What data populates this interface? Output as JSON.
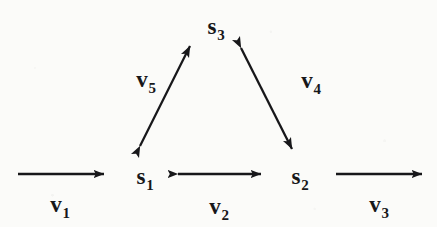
{
  "figure": {
    "kind": "state-transition-diagram",
    "background_color": "#fbfbf9",
    "ink_color": "#17171a",
    "width": 437,
    "height": 227
  },
  "nodes": [
    {
      "id": "s1",
      "base": "s",
      "sub": "1",
      "x": 145,
      "y": 176
    },
    {
      "id": "s2",
      "base": "s",
      "sub": "2",
      "x": 300,
      "y": 176
    },
    {
      "id": "s3",
      "base": "s",
      "sub": "3",
      "x": 216,
      "y": 26
    }
  ],
  "edges": [
    {
      "id": "v1",
      "base": "v",
      "sub": "1",
      "label_x": 60,
      "label_y": 204,
      "arrow": "single",
      "direction": "right",
      "from": "(boundary)",
      "to": "s1",
      "x1": 18,
      "y1": 174,
      "x2": 104,
      "y2": 174
    },
    {
      "id": "v2",
      "base": "v",
      "sub": "2",
      "label_x": 219,
      "label_y": 206,
      "arrow": "double",
      "direction": "horizontal",
      "from": "s1",
      "to": "s2",
      "x1": 178,
      "y1": 174,
      "x2": 261,
      "y2": 174
    },
    {
      "id": "v3",
      "base": "v",
      "sub": "3",
      "label_x": 379,
      "label_y": 204,
      "arrow": "single",
      "direction": "right",
      "from": "s2",
      "to": "(boundary)",
      "x1": 336,
      "y1": 174,
      "x2": 422,
      "y2": 174
    },
    {
      "id": "v4",
      "base": "v",
      "sub": "4",
      "label_x": 311,
      "label_y": 80,
      "arrow": "double",
      "direction": "diagonal-down-right",
      "from": "s3",
      "to": "s2",
      "x1": 241,
      "y1": 48,
      "x2": 292,
      "y2": 149
    },
    {
      "id": "v5",
      "base": "v",
      "sub": "5",
      "label_x": 146,
      "label_y": 79,
      "arrow": "double",
      "direction": "diagonal-up-right",
      "from": "s1",
      "to": "s3",
      "x1": 140,
      "y1": 146,
      "x2": 190,
      "y2": 46
    }
  ]
}
